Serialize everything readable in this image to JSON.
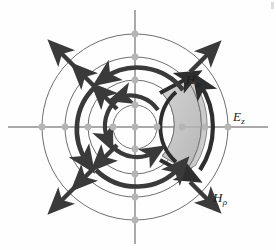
{
  "figure": {
    "background_color": "#fefefe",
    "center": {
      "x": 135,
      "y": 127
    },
    "axes": {
      "color": "#8c8c8c",
      "horizontal": {
        "x1": 8,
        "y1": 127,
        "x2": 268,
        "y2": 127
      },
      "vertical": {
        "x1": 135,
        "y1": 10,
        "x2": 135,
        "y2": 244
      }
    },
    "circles": {
      "stroke_color": "#595959",
      "radii": [
        22,
        47,
        70,
        93
      ],
      "count": 4
    },
    "nodes": {
      "color": "#b5b5b5",
      "radius_px": 3.4,
      "positions": [
        {
          "x": 135,
          "y": 127
        },
        {
          "x": 113,
          "y": 127
        },
        {
          "x": 88,
          "y": 127
        },
        {
          "x": 65,
          "y": 127
        },
        {
          "x": 42,
          "y": 127
        },
        {
          "x": 157,
          "y": 127
        },
        {
          "x": 182,
          "y": 127
        },
        {
          "x": 205,
          "y": 127
        },
        {
          "x": 228,
          "y": 127
        },
        {
          "x": 135,
          "y": 105
        },
        {
          "x": 135,
          "y": 80
        },
        {
          "x": 135,
          "y": 57
        },
        {
          "x": 135,
          "y": 34
        },
        {
          "x": 135,
          "y": 149
        },
        {
          "x": 135,
          "y": 174
        },
        {
          "x": 135,
          "y": 197
        },
        {
          "x": 135,
          "y": 220
        }
      ]
    },
    "cell": {
      "name": "shaded-annular-sector",
      "fill_color": "#c6c6c6",
      "edge_color": "#6e6e6e",
      "inner_radius": 47,
      "outer_radius": 78,
      "start_angle_deg": -38,
      "end_angle_deg": 38,
      "depth_offset": {
        "dx": -9,
        "dy": -5
      },
      "top_face_fill": "#d6d6d6",
      "side_face_fill": "#bdbdbd"
    },
    "arrow_color": "#3a3a3a",
    "radial_arrows": {
      "name": "H-rho-radial-arrows",
      "description": "outward radial arrows along 45-degree diagonals",
      "angles_deg": [
        45,
        135,
        225,
        315
      ],
      "radii": [
        40,
        62,
        86
      ],
      "length_px": 26
    },
    "azimuthal_arrows": {
      "name": "H-phi-arc-arrows",
      "description": "counterclockwise arc arrows between circles",
      "arcs": [
        {
          "radius": 34,
          "center_angle_deg": 90,
          "sweep_deg": 46,
          "direction": "ccw"
        },
        {
          "radius": 34,
          "center_angle_deg": 180,
          "sweep_deg": 46,
          "direction": "ccw"
        },
        {
          "radius": 34,
          "center_angle_deg": 270,
          "sweep_deg": 46,
          "direction": "ccw"
        },
        {
          "radius": 58,
          "center_angle_deg": 90,
          "sweep_deg": 46,
          "direction": "ccw"
        },
        {
          "radius": 58,
          "center_angle_deg": 180,
          "sweep_deg": 46,
          "direction": "ccw"
        },
        {
          "radius": 58,
          "center_angle_deg": 270,
          "sweep_deg": 46,
          "direction": "ccw"
        },
        {
          "radius": 82,
          "center_angle_deg": 90,
          "sweep_deg": 40,
          "direction": "ccw"
        },
        {
          "radius": 82,
          "center_angle_deg": 270,
          "sweep_deg": 40,
          "direction": "ccw"
        }
      ]
    }
  },
  "labels": {
    "h_phi": {
      "base": "H",
      "sub": "φ",
      "full": "Hφ"
    },
    "e_z": {
      "base": "E",
      "sub": "z",
      "full": "Ez"
    },
    "h_rho": {
      "base": "H",
      "sub": "ρ",
      "full": "Hρ"
    }
  }
}
